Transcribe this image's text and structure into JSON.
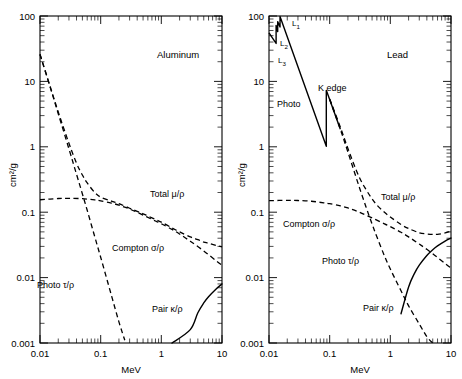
{
  "figure": {
    "xlabel": "MeV",
    "ylabel": "cm2/g",
    "ylabel_display": "cm²/g"
  },
  "axes": {
    "x_ticklabels": [
      "0.01",
      "0.1",
      "1",
      "10"
    ],
    "y_ticklabels": [
      "100",
      "10",
      "1",
      "0.1",
      "0.01",
      "0.001"
    ],
    "xlim": [
      0.01,
      10
    ],
    "ylim": [
      0.001,
      100
    ],
    "xscale": "log",
    "yscale": "log",
    "grid": "off",
    "tick_direction": "in"
  },
  "panels": [
    {
      "id": "aluminum",
      "title": "Aluminum",
      "labels": {
        "total": "Total μ/ρ",
        "compton": "Compton σ/ρ",
        "photo": "Photo τ/ρ",
        "pair": "Pair κ/ρ"
      }
    },
    {
      "id": "lead",
      "title": "Lead",
      "labels": {
        "total": "Total μ/ρ",
        "compton": "Compton σ/ρ",
        "photo_curve": "Photo",
        "photo": "Photo τ/ρ",
        "pair": "Pair κ/ρ",
        "k_edge": "K edge",
        "l1_edge": "L",
        "l1_sub": "1",
        "l2_edge": "L",
        "l2_sub": "2",
        "l3_edge": "L",
        "l3_sub": "3"
      }
    }
  ],
  "chart_data": {
    "type": "line",
    "title": "",
    "xlabel": "MeV",
    "ylabel": "cm2/g",
    "xscale": "log",
    "yscale": "log",
    "xlim": [
      0.01,
      10
    ],
    "ylim": [
      0.001,
      100
    ],
    "legend_position": "inline-annotations",
    "panels": [
      {
        "name": "Aluminum",
        "series": [
          {
            "name": "Total μ/ρ",
            "style": "solid",
            "x": [
              0.01,
              0.015,
              0.02,
              0.03,
              0.04,
              0.05,
              0.06,
              0.08,
              0.1,
              0.15,
              0.2,
              0.3,
              0.4,
              0.5,
              0.6,
              0.8,
              1.0,
              1.5,
              2.0,
              3.0,
              4.0,
              5.0,
              6.0,
              8.0,
              10.0
            ],
            "y": [
              26.0,
              7.9,
              3.4,
              1.13,
              0.56,
              0.37,
              0.28,
              0.2,
              0.17,
              0.148,
              0.135,
              0.115,
              0.103,
              0.0945,
              0.0875,
              0.0775,
              0.0705,
              0.0575,
              0.05,
              0.042,
              0.038,
              0.035,
              0.0335,
              0.031,
              0.0295
            ]
          },
          {
            "name": "Compton σ/ρ",
            "style": "dashed",
            "x": [
              0.01,
              0.02,
              0.03,
              0.05,
              0.08,
              0.1,
              0.15,
              0.2,
              0.3,
              0.5,
              0.8,
              1.0,
              1.5,
              2.0,
              3.0,
              5.0,
              8.0,
              10.0
            ],
            "y": [
              0.155,
              0.162,
              0.163,
              0.161,
              0.154,
              0.149,
              0.138,
              0.128,
              0.112,
              0.0905,
              0.0733,
              0.0665,
              0.0545,
              0.0463,
              0.036,
              0.0256,
              0.0181,
              0.0155
            ]
          },
          {
            "name": "Photo τ/ρ",
            "style": "dashed",
            "x": [
              0.01,
              0.015,
              0.02,
              0.03,
              0.04,
              0.05,
              0.06,
              0.08,
              0.1,
              0.15,
              0.2,
              0.25
            ],
            "y": [
              25.8,
              7.7,
              3.2,
              0.93,
              0.38,
              0.19,
              0.107,
              0.042,
              0.0205,
              0.0054,
              0.0021,
              0.0011
            ]
          },
          {
            "name": "Pair κ/ρ",
            "style": "dashed",
            "x": [
              1.02,
              1.25,
              1.5,
              2.0,
              2.5,
              3.0,
              4.0,
              5.0,
              6.0,
              8.0,
              10.0
            ],
            "y": [
              3e-05,
              0.00035,
              0.00095,
              0.00029,
              0.0009,
              0.0016,
              0.0029,
              0.0041,
              0.0051,
              0.0067,
              0.008
            ]
          }
        ]
      },
      {
        "name": "Lead",
        "series": [
          {
            "name": "Total μ/ρ",
            "style": "solid",
            "x": [
              0.1,
              0.15,
              0.2,
              0.3,
              0.4,
              0.5,
              0.6,
              0.8,
              1.0,
              1.5,
              2.0,
              3.0,
              4.0,
              5.0,
              6.0,
              8.0,
              10.0
            ],
            "y": [
              5.4,
              2.0,
              0.94,
              0.36,
              0.22,
              0.16,
              0.129,
              0.0995,
              0.0845,
              0.0648,
              0.0563,
              0.0485,
              0.0465,
              0.0458,
              0.0459,
              0.0482,
              0.0512
            ]
          },
          {
            "name": "Compton σ/ρ",
            "style": "dashed",
            "x": [
              0.01,
              0.02,
              0.03,
              0.05,
              0.08,
              0.1,
              0.15,
              0.2,
              0.3,
              0.5,
              0.8,
              1.0,
              1.5,
              2.0,
              3.0,
              5.0,
              8.0,
              10.0
            ],
            "y": [
              0.15,
              0.152,
              0.151,
              0.147,
              0.139,
              0.135,
              0.125,
              0.116,
              0.101,
              0.0818,
              0.0663,
              0.0602,
              0.0493,
              0.0419,
              0.0326,
              0.0232,
              0.0164,
              0.014
            ]
          },
          {
            "name": "Photo τ/ρ",
            "style": "dashed",
            "x": [
              0.1,
              0.15,
              0.2,
              0.3,
              0.4,
              0.5,
              0.6,
              0.8,
              1.0,
              1.5,
              2.0,
              3.0,
              4.0,
              5.0,
              6.0,
              8.0
            ],
            "y": [
              5.3,
              1.85,
              0.83,
              0.26,
              0.118,
              0.066,
              0.042,
              0.0215,
              0.0135,
              0.0063,
              0.0037,
              0.00195,
              0.00125,
              0.00093,
              0.00072,
              0.00048
            ]
          },
          {
            "name": "Pair κ/ρ",
            "style": "dashed",
            "x": [
              1.02,
              1.2,
              1.5,
              2.0,
              2.5,
              3.0,
              4.0,
              5.0,
              6.0,
              8.0,
              10.0
            ],
            "y": [
              2e-05,
              0.0008,
              0.0028,
              0.0072,
              0.0116,
              0.0155,
              0.0218,
              0.0267,
              0.0305,
              0.0362,
              0.0402
            ]
          },
          {
            "name": "Photo (low-energy, with edges)",
            "style": "solid",
            "description": "Photoelectric absorption below 0.1 MeV showing K edge at 0.088 MeV and L edges near 0.013-0.015 MeV",
            "x": [
              0.01,
              0.0131,
              0.0131,
              0.0139,
              0.0139,
              0.0152,
              0.0152,
              0.088,
              0.088,
              0.1,
              0.15
            ],
            "y": [
              55.0,
              38.0,
              72.0,
              58.0,
              82.0,
              68.0,
              98.0,
              1.02,
              7.3,
              5.3,
              1.85
            ],
            "edges": [
              {
                "name": "L3",
                "energy": 0.0131
              },
              {
                "name": "L2",
                "energy": 0.0139
              },
              {
                "name": "L1",
                "energy": 0.0152
              },
              {
                "name": "K edge",
                "energy": 0.088
              }
            ]
          }
        ]
      }
    ]
  }
}
